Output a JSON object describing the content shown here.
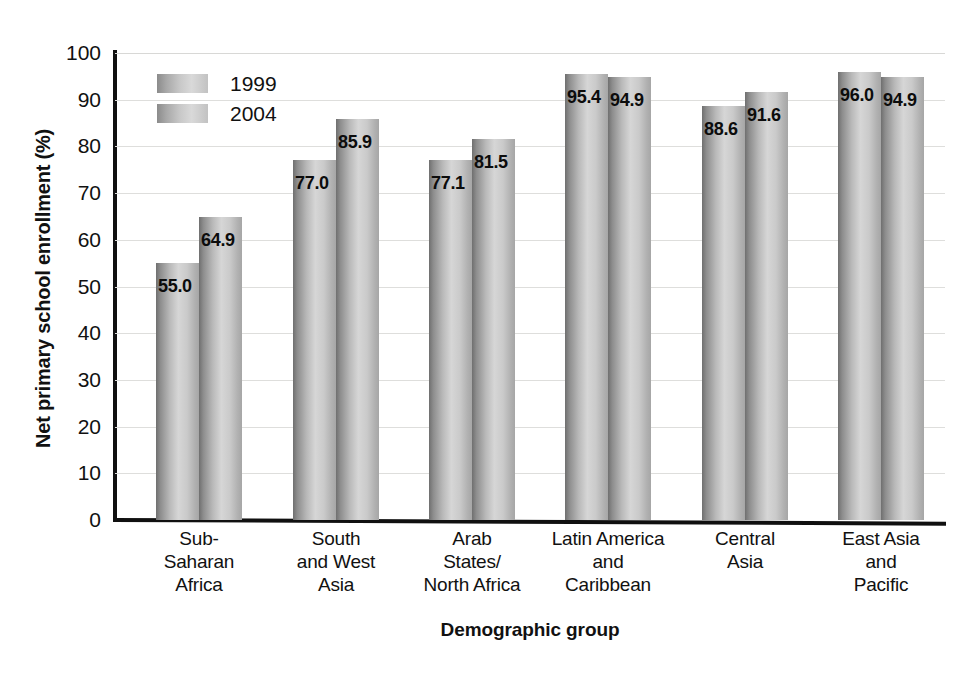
{
  "chart_data": {
    "type": "bar",
    "title": "",
    "xlabel": "Demographic group",
    "ylabel": "Net primary school enrollment (%)",
    "ylim": [
      0,
      100
    ],
    "ytick_step": 10,
    "yticks": [
      "100",
      "90",
      "80",
      "70",
      "60",
      "50",
      "40",
      "30",
      "20",
      "10",
      "0"
    ],
    "grid": true,
    "legend_position": "top-left",
    "categories": [
      "Sub-\nSaharan\nAfrica",
      "South\nand West\nAsia",
      "Arab\nStates/\nNorth Africa",
      "Latin America\nand\nCaribbean",
      "Central\nAsia",
      "East Asia\nand\nPacific"
    ],
    "series": [
      {
        "name": "1999",
        "values": [
          55.0,
          77.0,
          77.1,
          95.4,
          88.6,
          96.0
        ]
      },
      {
        "name": "2004",
        "values": [
          64.9,
          85.9,
          81.5,
          94.9,
          91.6,
          94.9
        ]
      }
    ],
    "data_labels": [
      [
        "55.0",
        "64.9"
      ],
      [
        "77.0",
        "85.9"
      ],
      [
        "77.1",
        "81.5"
      ],
      [
        "95.4",
        "94.9"
      ],
      [
        "88.6",
        "91.6"
      ],
      [
        "96.0",
        "94.9"
      ]
    ],
    "colors": {
      "bar_dark_edge": "#6f6f6f",
      "bar_light": "#d6d6d6",
      "axis": "#101010",
      "gridline": "#dededc",
      "text": "#111111",
      "background": "#ffffff"
    }
  },
  "legend": {
    "items": [
      {
        "label": "1999"
      },
      {
        "label": "2004"
      }
    ]
  },
  "axes": {
    "y_title": "Net primary school enrollment (%)",
    "x_title": "Demographic group"
  },
  "category_lines": [
    [
      "Sub-",
      "Saharan",
      "Africa"
    ],
    [
      "South",
      "and West",
      "Asia"
    ],
    [
      "Arab",
      "States/",
      "North Africa"
    ],
    [
      "Latin America",
      "and",
      "Caribbean"
    ],
    [
      "Central",
      "Asia"
    ],
    [
      "East Asia",
      "and",
      "Pacific"
    ]
  ]
}
